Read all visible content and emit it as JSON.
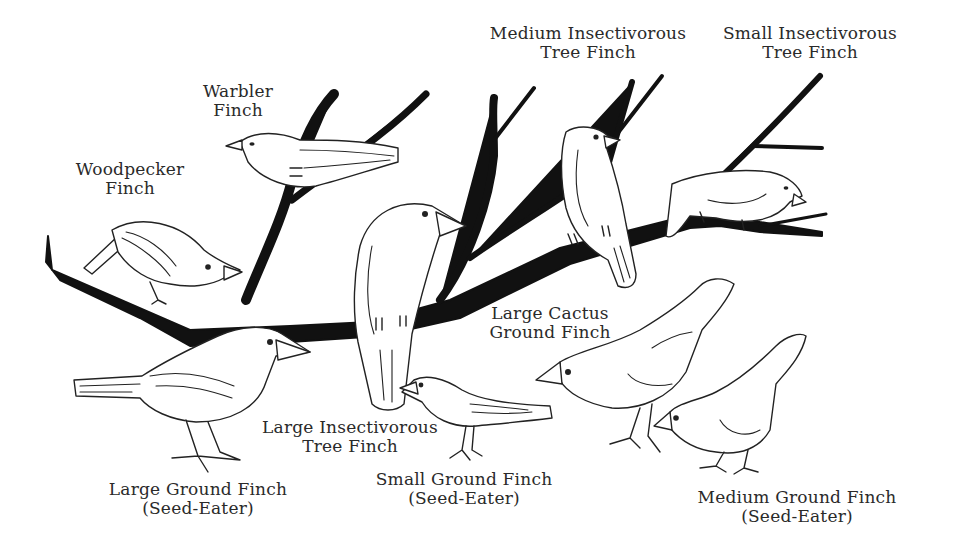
{
  "diagram": {
    "colors": {
      "background": "#ffffff",
      "ink": "#111111",
      "label_text": "#2a2a2a"
    }
  },
  "labels": {
    "medium_insectivorous_tree_finch": {
      "line1": "Medium Insectivorous",
      "line2": "Tree Finch"
    },
    "small_insectivorous_tree_finch": {
      "line1": "Small Insectivorous",
      "line2": "Tree Finch"
    },
    "warbler_finch": {
      "line1": "Warbler",
      "line2": "Finch"
    },
    "woodpecker_finch": {
      "line1": "Woodpecker",
      "line2": "Finch"
    },
    "large_cactus_ground_finch": {
      "line1": "Large Cactus",
      "line2": "Ground Finch"
    },
    "large_insectivorous_tree_finch": {
      "line1": "Large Insectivorous",
      "line2": "Tree Finch"
    },
    "large_ground_finch": {
      "line1": "Large Ground Finch",
      "line2": "(Seed-Eater)"
    },
    "small_ground_finch": {
      "line1": "Small Ground Finch",
      "line2": "(Seed-Eater)"
    },
    "medium_ground_finch": {
      "line1": "Medium Ground Finch",
      "line2": "(Seed-Eater)"
    }
  }
}
